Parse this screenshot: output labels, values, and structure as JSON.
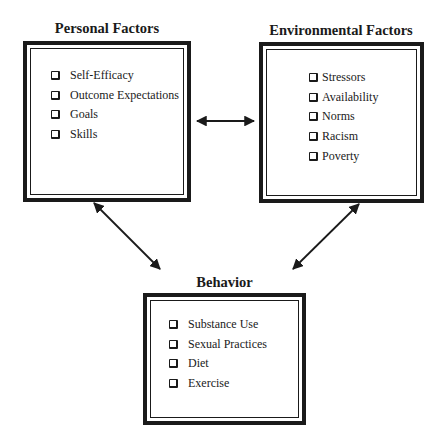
{
  "diagram": {
    "nodes": [
      {
        "id": "personal",
        "title": "Personal Factors",
        "items": [
          "Self-Efficacy",
          "Outcome Expectations",
          "Goals",
          "Skills"
        ]
      },
      {
        "id": "environmental",
        "title": "Environmental Factors",
        "items": [
          "Stressors",
          "Availability",
          "Norms",
          "Racism",
          "Poverty"
        ]
      },
      {
        "id": "behavior",
        "title": "Behavior",
        "items": [
          "Substance Use",
          "Sexual Practices",
          "Diet",
          "Exercise"
        ]
      }
    ],
    "edges": [
      {
        "from": "personal",
        "to": "environmental",
        "type": "bidirectional"
      },
      {
        "from": "personal",
        "to": "behavior",
        "type": "bidirectional"
      },
      {
        "from": "environmental",
        "to": "behavior",
        "type": "bidirectional"
      }
    ],
    "checkbox_icon": "checkbox-square-icon",
    "colors": {
      "line": "#1a1a1a",
      "background": "#ffffff"
    }
  }
}
